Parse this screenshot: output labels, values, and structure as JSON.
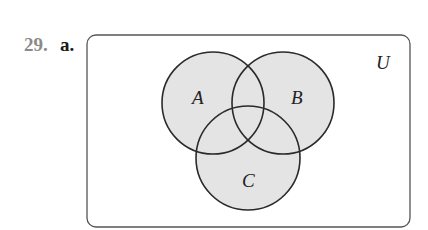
{
  "problem": {
    "number": "29.",
    "part": "a."
  },
  "diagram": {
    "type": "venn",
    "universe_label": "U",
    "sets": [
      {
        "label": "A",
        "cx": 213,
        "cy": 103,
        "r": 51
      },
      {
        "label": "B",
        "cx": 283,
        "cy": 103,
        "r": 51
      },
      {
        "label": "C",
        "cx": 248,
        "cy": 158,
        "r": 52
      }
    ],
    "shaded_region": "A ∪ B ∪ C",
    "fill_color": "#e4e4e4",
    "stroke_color": "#2a2a2a"
  }
}
